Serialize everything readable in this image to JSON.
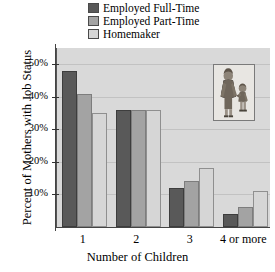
{
  "chart_data": {
    "type": "bar",
    "title": "",
    "xlabel": "Number of Children",
    "ylabel": "Percent of Mothers with Job Status",
    "categories": [
      "1",
      "2",
      "3",
      "4 or more"
    ],
    "series": [
      {
        "name": "Employed Full-Time",
        "color": "#595959",
        "values": [
          48,
          36,
          12,
          4
        ]
      },
      {
        "name": "Employed Part-Time",
        "color": "#a3a3a3",
        "values": [
          41,
          36,
          14,
          6
        ]
      },
      {
        "name": "Homemaker",
        "color": "#d6d6d6",
        "values": [
          35,
          36,
          18,
          11
        ]
      }
    ],
    "ylim": [
      0,
      55
    ],
    "yticks": [
      10,
      20,
      30,
      40,
      50
    ],
    "ytick_labels": [
      "10%",
      "20%",
      "30%",
      "40%",
      "50%"
    ],
    "grid": true,
    "legend_position": "top-center"
  },
  "legend": {
    "items": [
      {
        "label": "Employed Full-Time",
        "color": "#595959"
      },
      {
        "label": "Employed Part-Time",
        "color": "#a3a3a3"
      },
      {
        "label": "Homemaker",
        "color": "#d6d6d6"
      }
    ]
  },
  "inset": {
    "name": "mother-and-child-illustration",
    "alt": "Illustration of a mother holding a child's hand"
  }
}
